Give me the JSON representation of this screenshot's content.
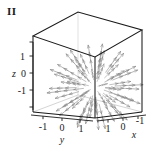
{
  "figure": {
    "label": "II",
    "caption": ""
  },
  "chart_data": {
    "type": "scatter",
    "title": "II",
    "subtitle": "3D radial vector field on a cube",
    "field_description": "Arrows point radially outward from the origin; lengths grow with distance from the origin.",
    "xlabel": "x",
    "ylabel": "y",
    "zlabel": "z",
    "xlim": [
      1,
      -1
    ],
    "ylim": [
      -1,
      1
    ],
    "zlim": [
      -1.5,
      1.5
    ],
    "grid": false,
    "legend": "none",
    "x_ticks": [
      "1",
      "0",
      "-1"
    ],
    "y_ticks": [
      "-1",
      "0",
      "1"
    ],
    "z_ticks": [
      "1",
      "0",
      "-1"
    ],
    "box": "cube wireframe with visible front vertical edge",
    "arrow_color": "#8c8c8c",
    "frame_color": "#1a1a1a",
    "n_arrows": 200
  },
  "axes": {
    "x": {
      "name": "x",
      "ticks": [
        {
          "value": 1,
          "label": "1"
        },
        {
          "value": 0,
          "label": "0"
        },
        {
          "value": -1,
          "label": "-1"
        }
      ]
    },
    "y": {
      "name": "y",
      "ticks": [
        {
          "value": -1,
          "label": "-1"
        },
        {
          "value": 0,
          "label": "0"
        },
        {
          "value": 1,
          "label": "1"
        }
      ]
    },
    "z": {
      "name": "z",
      "ticks": [
        {
          "value": 1,
          "label": "1"
        },
        {
          "value": 0,
          "label": "0"
        },
        {
          "value": -1,
          "label": "-1"
        }
      ]
    }
  },
  "colors": {
    "arrow": "#8c8c8c",
    "frame": "#1a1a1a",
    "background": "#ffffff",
    "text": "#1a1a1a"
  }
}
